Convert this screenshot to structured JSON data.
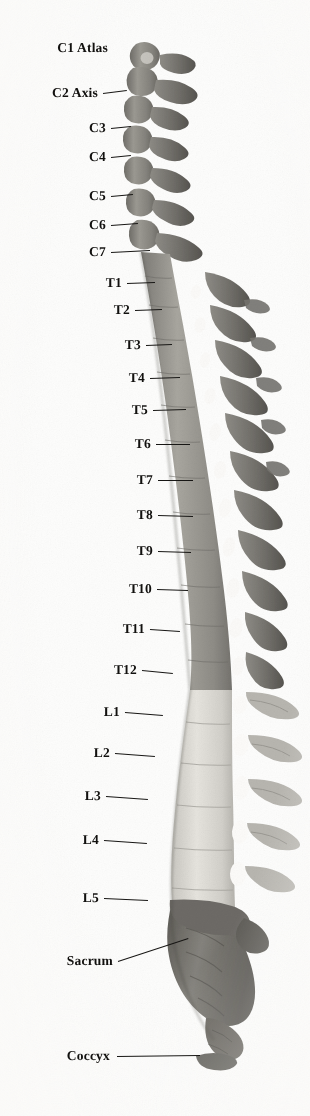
{
  "figure": {
    "view": "lateral",
    "background_color": "#fdfdfc",
    "ink_color": "#171614"
  },
  "regions": [
    {
      "name": "cervical",
      "label": "Cervical",
      "vertebrae": 7,
      "tone": "#8d8b86"
    },
    {
      "name": "thoracic",
      "label": "Thoracic",
      "vertebrae": 12,
      "tone": "#9a9892"
    },
    {
      "name": "lumbar",
      "label": "Lumbar",
      "vertebrae": 5,
      "tone": "#d8d6d0"
    },
    {
      "name": "sacrum",
      "label": "Sacrum",
      "vertebrae": 5,
      "tone": "#6f6d68"
    },
    {
      "name": "coccyx",
      "label": "Coccyx",
      "vertebrae": 4,
      "tone": "#6a6862"
    }
  ],
  "labels": [
    {
      "id": "c1",
      "text": "C1 Atlas",
      "text_x": 108,
      "y": 48,
      "line_from": 112,
      "line_to": 112,
      "line_y2": 48,
      "region": "cervical"
    },
    {
      "id": "c2",
      "text": "C2 Axis",
      "text_x": 98,
      "y": 93,
      "line_from": 103,
      "line_to": 127,
      "line_y2": 90,
      "region": "cervical"
    },
    {
      "id": "c3",
      "text": "C3",
      "text_x": 106,
      "y": 128,
      "line_from": 111,
      "line_to": 131,
      "line_y2": 126,
      "region": "cervical"
    },
    {
      "id": "c4",
      "text": "C4",
      "text_x": 106,
      "y": 157,
      "line_from": 111,
      "line_to": 131,
      "line_y2": 155,
      "region": "cervical"
    },
    {
      "id": "c5",
      "text": "C5",
      "text_x": 106,
      "y": 196,
      "line_from": 111,
      "line_to": 133,
      "line_y2": 194,
      "region": "cervical"
    },
    {
      "id": "c6",
      "text": "C6",
      "text_x": 106,
      "y": 225,
      "line_from": 111,
      "line_to": 138,
      "line_y2": 223,
      "region": "cervical"
    },
    {
      "id": "c7",
      "text": "C7",
      "text_x": 106,
      "y": 252,
      "line_from": 111,
      "line_to": 150,
      "line_y2": 250,
      "region": "cervical"
    },
    {
      "id": "t1",
      "text": "T1",
      "text_x": 122,
      "y": 283,
      "line_from": 127,
      "line_to": 155,
      "line_y2": 282,
      "region": "thoracic"
    },
    {
      "id": "t2",
      "text": "T2",
      "text_x": 130,
      "y": 310,
      "line_from": 135,
      "line_to": 162,
      "line_y2": 309,
      "region": "thoracic"
    },
    {
      "id": "t3",
      "text": "T3",
      "text_x": 141,
      "y": 345,
      "line_from": 146,
      "line_to": 172,
      "line_y2": 344,
      "region": "thoracic"
    },
    {
      "id": "t4",
      "text": "T4",
      "text_x": 145,
      "y": 378,
      "line_from": 150,
      "line_to": 180,
      "line_y2": 377,
      "region": "thoracic"
    },
    {
      "id": "t5",
      "text": "T5",
      "text_x": 148,
      "y": 410,
      "line_from": 153,
      "line_to": 186,
      "line_y2": 409,
      "region": "thoracic"
    },
    {
      "id": "t6",
      "text": "T6",
      "text_x": 151,
      "y": 444,
      "line_from": 156,
      "line_to": 190,
      "line_y2": 444,
      "region": "thoracic"
    },
    {
      "id": "t7",
      "text": "T7",
      "text_x": 153,
      "y": 480,
      "line_from": 158,
      "line_to": 193,
      "line_y2": 480,
      "region": "thoracic"
    },
    {
      "id": "t8",
      "text": "T8",
      "text_x": 153,
      "y": 515,
      "line_from": 158,
      "line_to": 193,
      "line_y2": 516,
      "region": "thoracic"
    },
    {
      "id": "t9",
      "text": "T9",
      "text_x": 153,
      "y": 551,
      "line_from": 158,
      "line_to": 191,
      "line_y2": 552,
      "region": "thoracic"
    },
    {
      "id": "t10",
      "text": "T10",
      "text_x": 152,
      "y": 589,
      "line_from": 157,
      "line_to": 188,
      "line_y2": 590,
      "region": "thoracic"
    },
    {
      "id": "t11",
      "text": "T11",
      "text_x": 145,
      "y": 629,
      "line_from": 150,
      "line_to": 180,
      "line_y2": 631,
      "region": "thoracic"
    },
    {
      "id": "t12",
      "text": "T12",
      "text_x": 137,
      "y": 670,
      "line_from": 142,
      "line_to": 173,
      "line_y2": 673,
      "region": "thoracic"
    },
    {
      "id": "l1",
      "text": "L1",
      "text_x": 120,
      "y": 712,
      "line_from": 125,
      "line_to": 163,
      "line_y2": 715,
      "region": "lumbar"
    },
    {
      "id": "l2",
      "text": "L2",
      "text_x": 110,
      "y": 753,
      "line_from": 115,
      "line_to": 155,
      "line_y2": 756,
      "region": "lumbar"
    },
    {
      "id": "l3",
      "text": "L3",
      "text_x": 101,
      "y": 796,
      "line_from": 106,
      "line_to": 148,
      "line_y2": 799,
      "region": "lumbar"
    },
    {
      "id": "l4",
      "text": "L4",
      "text_x": 99,
      "y": 840,
      "line_from": 104,
      "line_to": 147,
      "line_y2": 843,
      "region": "lumbar"
    },
    {
      "id": "l5",
      "text": "L5",
      "text_x": 99,
      "y": 898,
      "line_from": 104,
      "line_to": 148,
      "line_y2": 900,
      "region": "lumbar"
    },
    {
      "id": "sacrum",
      "text": "Sacrum",
      "text_x": 113,
      "y": 961,
      "line_from": 118,
      "line_to": 188,
      "line_y2": 938,
      "region": "sacrum"
    },
    {
      "id": "coccyx",
      "text": "Coccyx",
      "text_x": 110,
      "y": 1056,
      "line_from": 117,
      "line_to": 200,
      "line_y2": 1055,
      "region": "coccyx"
    }
  ]
}
